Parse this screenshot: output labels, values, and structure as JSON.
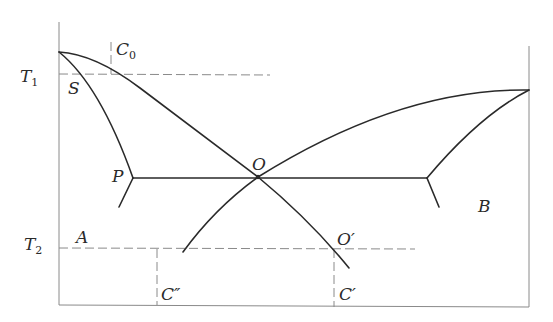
{
  "diagram": {
    "type": "ternary eutectic / phase diagram schematic",
    "labels": {
      "T1": "T",
      "T1_sub": "1",
      "T2": "T",
      "T2_sub": "2",
      "C0": "C",
      "C0_sub": "0",
      "S": "S",
      "P": "P",
      "O": "O",
      "O_prime": "O′",
      "A": "A",
      "B": "B",
      "C_prime": "C′",
      "C_double_prime": "C″"
    },
    "colors": {
      "curve": "#2a2a2a",
      "axis": "#8a8a8a",
      "background": "#ffffff"
    }
  }
}
